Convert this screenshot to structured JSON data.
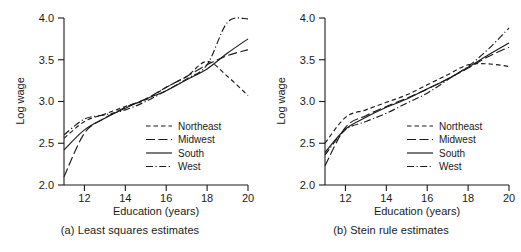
{
  "figure": {
    "panels": [
      {
        "id": "a",
        "caption": "(a) Least squares estimates"
      },
      {
        "id": "b",
        "caption": "(b) Stein rule estimates"
      }
    ]
  },
  "chart_data": [
    {
      "type": "line",
      "title": "(a) Least squares estimates",
      "xlabel": "Education (years)",
      "ylabel": "Log wage",
      "xlim": [
        11,
        20
      ],
      "ylim": [
        2.0,
        4.0
      ],
      "xticks": [
        12,
        14,
        16,
        18,
        20
      ],
      "yticks": [
        2.0,
        2.5,
        3.0,
        3.5,
        4.0
      ],
      "xtick_labels": [
        "12",
        "14",
        "16",
        "18",
        "20"
      ],
      "ytick_labels": [
        "2.0",
        "2.5",
        "3.0",
        "3.5",
        "4.0"
      ],
      "grid": false,
      "legend_position": "lower right",
      "x": [
        11,
        12,
        13,
        14,
        15,
        16,
        17,
        18,
        19,
        20
      ],
      "series": [
        {
          "name": "Northeast",
          "dash": "short-dash",
          "values": [
            2.56,
            2.76,
            2.85,
            2.94,
            3.02,
            3.17,
            3.3,
            3.48,
            3.3,
            3.07
          ]
        },
        {
          "name": "Midwest",
          "dash": "long-dash",
          "values": [
            2.1,
            2.62,
            2.8,
            2.93,
            3.03,
            3.17,
            3.3,
            3.44,
            3.55,
            3.62
          ]
        },
        {
          "name": "South",
          "dash": "solid",
          "values": [
            2.42,
            2.66,
            2.8,
            2.92,
            3.03,
            3.13,
            3.26,
            3.39,
            3.58,
            3.75
          ]
        },
        {
          "name": "West",
          "dash": "dash-dot",
          "values": [
            2.6,
            2.79,
            2.84,
            2.9,
            3.0,
            3.13,
            3.27,
            3.44,
            3.95,
            3.99
          ]
        }
      ]
    },
    {
      "type": "line",
      "title": "(b) Stein rule estimates",
      "xlabel": "Education (years)",
      "ylabel": "Log wage",
      "xlim": [
        11,
        20
      ],
      "ylim": [
        2.0,
        4.0
      ],
      "xticks": [
        12,
        14,
        16,
        18,
        20
      ],
      "yticks": [
        2.0,
        2.5,
        3.0,
        3.5,
        4.0
      ],
      "xtick_labels": [
        "12",
        "14",
        "16",
        "18",
        "20"
      ],
      "ytick_labels": [
        "2.0",
        "2.5",
        "3.0",
        "3.5",
        "4.0"
      ],
      "grid": false,
      "legend_position": "lower right",
      "x": [
        11,
        12,
        13,
        14,
        15,
        16,
        17,
        18,
        19,
        20
      ],
      "series": [
        {
          "name": "Northeast",
          "dash": "short-dash",
          "values": [
            2.5,
            2.81,
            2.9,
            2.99,
            3.08,
            3.2,
            3.32,
            3.44,
            3.45,
            3.42
          ]
        },
        {
          "name": "Midwest",
          "dash": "long-dash",
          "values": [
            2.23,
            2.69,
            2.83,
            2.94,
            3.04,
            3.15,
            3.27,
            3.4,
            3.54,
            3.65
          ]
        },
        {
          "name": "South",
          "dash": "solid",
          "values": [
            2.39,
            2.67,
            2.81,
            2.93,
            3.03,
            3.15,
            3.27,
            3.41,
            3.56,
            3.7
          ]
        },
        {
          "name": "West",
          "dash": "dash-dot",
          "values": [
            2.36,
            2.66,
            2.76,
            2.86,
            2.98,
            3.1,
            3.26,
            3.42,
            3.63,
            3.88
          ]
        }
      ]
    }
  ],
  "axes": {
    "xlabel": "Education (years)",
    "ylabel": "Log wage",
    "xtick_labels": [
      "12",
      "14",
      "16",
      "18",
      "20"
    ],
    "ytick_labels": [
      "2.0",
      "2.5",
      "3.0",
      "3.5",
      "4.0"
    ]
  },
  "legend": {
    "entries": [
      {
        "label": "Northeast",
        "dash": "short-dash"
      },
      {
        "label": "Midwest",
        "dash": "long-dash"
      },
      {
        "label": "South",
        "dash": "solid"
      },
      {
        "label": "West",
        "dash": "dash-dot"
      }
    ]
  },
  "colors": {
    "ink": "#1a1a1a",
    "background": "#ffffff"
  }
}
